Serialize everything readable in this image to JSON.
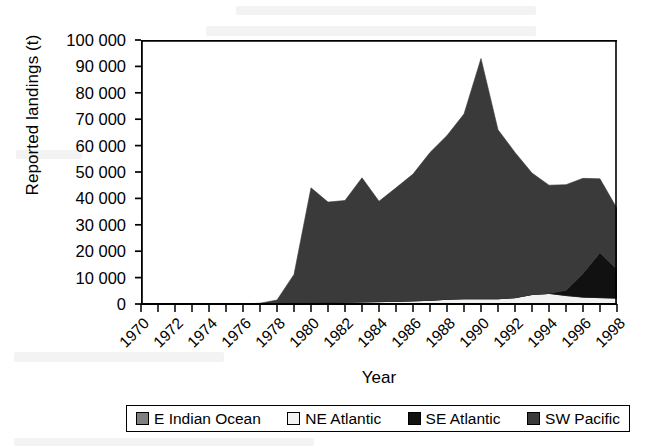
{
  "figure": {
    "background": "#ffffff",
    "frame_color": "#000000"
  },
  "axes": {
    "ylabel": "Reported landings (t)",
    "xlabel": "Year"
  },
  "legend": {
    "items": [
      {
        "label": "E Indian Ocean",
        "color": "#808080",
        "key": "e-indian-ocean"
      },
      {
        "label": "NE Atlantic",
        "color": "#f2f2f2",
        "key": "ne-atlantic"
      },
      {
        "label": "SE Atlantic",
        "color": "#111111",
        "key": "se-atlantic"
      },
      {
        "label": "SW Pacific",
        "color": "#3a3a3a",
        "key": "sw-pacific"
      }
    ]
  },
  "chart_data": {
    "type": "area",
    "stacked": true,
    "title": "",
    "xlabel": "Year",
    "ylabel": "Reported landings (t)",
    "xlim": [
      1970,
      1998
    ],
    "ylim": [
      0,
      100000
    ],
    "ytick_step": 10000,
    "grid": false,
    "legend_position": "bottom",
    "x": [
      1970,
      1971,
      1972,
      1973,
      1974,
      1975,
      1976,
      1977,
      1978,
      1979,
      1980,
      1981,
      1982,
      1983,
      1984,
      1985,
      1986,
      1987,
      1988,
      1989,
      1990,
      1991,
      1992,
      1993,
      1994,
      1995,
      1996,
      1997,
      1998
    ],
    "xticks": [
      1970,
      1972,
      1974,
      1976,
      1978,
      1980,
      1982,
      1984,
      1986,
      1988,
      1990,
      1992,
      1994,
      1996,
      1998
    ],
    "xtick_labels": [
      "1970",
      "1972",
      "1974",
      "1976",
      "1978",
      "1980",
      "1982",
      "1984",
      "1986",
      "1988",
      "1990",
      "1992",
      "1994",
      "1996",
      "1998"
    ],
    "yticks": [
      0,
      10000,
      20000,
      30000,
      40000,
      50000,
      60000,
      70000,
      80000,
      90000,
      100000
    ],
    "ytick_labels": [
      "0",
      "10 000",
      "20 000",
      "30 000",
      "40 000",
      "50 000",
      "60 000",
      "70 000",
      "80 000",
      "90 000",
      "100 000"
    ],
    "series": [
      {
        "name": "E Indian Ocean",
        "color": "#808080",
        "values": [
          0,
          0,
          0,
          0,
          0,
          0,
          0,
          0,
          0,
          0,
          0,
          0,
          0,
          0,
          0,
          0,
          0,
          0,
          0,
          0,
          0,
          0,
          0,
          0,
          0,
          0,
          0,
          0,
          0
        ]
      },
      {
        "name": "NE Atlantic",
        "color": "#f2f2f2",
        "values": [
          0,
          0,
          0,
          0,
          0,
          0,
          0,
          0,
          0,
          200,
          500,
          600,
          700,
          800,
          900,
          1000,
          1200,
          1400,
          1800,
          2000,
          2000,
          2000,
          2400,
          3600,
          4000,
          3200,
          2600,
          2400,
          2200
        ]
      },
      {
        "name": "SE Atlantic",
        "color": "#111111",
        "values": [
          0,
          0,
          0,
          0,
          0,
          0,
          0,
          0,
          0,
          0,
          0,
          0,
          0,
          0,
          0,
          0,
          0,
          0,
          0,
          0,
          0,
          0,
          0,
          0,
          0,
          2000,
          9000,
          17000,
          11000
        ]
      },
      {
        "name": "SW Pacific",
        "color": "#3a3a3a",
        "values": [
          0,
          0,
          0,
          0,
          0,
          0,
          0,
          300,
          1500,
          11000,
          43500,
          38000,
          38500,
          47000,
          38000,
          43000,
          48000,
          56000,
          62000,
          70000,
          91000,
          64000,
          55000,
          46000,
          41000,
          40000,
          36000,
          28000,
          23000
        ]
      }
    ],
    "totals": [
      0,
      0,
      0,
      0,
      0,
      0,
      0,
      300,
      1500,
      11200,
      44000,
      38600,
      39200,
      47800,
      38900,
      44000,
      49200,
      57400,
      63800,
      72000,
      93000,
      66000,
      57400,
      49600,
      45000,
      45200,
      47600,
      47400,
      36200
    ],
    "annotations": {
      "peak_year": 1990,
      "peak_value": 93000,
      "onset_year": 1978
    }
  }
}
